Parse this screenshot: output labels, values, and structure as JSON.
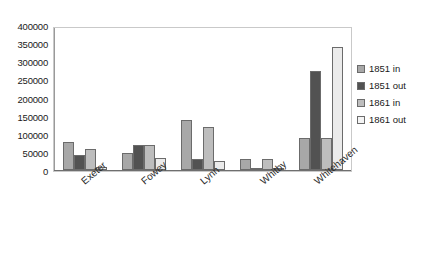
{
  "chart_data": {
    "type": "bar",
    "title": "",
    "subtitle": "",
    "xlabel": "",
    "ylabel": "",
    "categories": [
      "Exeter",
      "Fowey",
      "Lynn",
      "Whitby",
      "Whitehaven"
    ],
    "series": [
      {
        "name": "1851 in",
        "color": "#a8a8a8",
        "values": [
          78000,
          48000,
          140000,
          30000,
          90000
        ]
      },
      {
        "name": "1851 out",
        "color": "#525252",
        "values": [
          42000,
          70000,
          30000,
          3000,
          278000
        ]
      },
      {
        "name": "1861 in",
        "color": "#bdbdbd",
        "values": [
          58000,
          70000,
          120000,
          30000,
          90000
        ]
      },
      {
        "name": "1861 out",
        "color": "#ebebeb",
        "values": [
          9000,
          35000,
          25000,
          5000,
          345000
        ]
      }
    ],
    "ylim": [
      0,
      400000
    ],
    "ytick_step": 50000,
    "yticks": [
      400000,
      350000,
      300000,
      250000,
      200000,
      150000,
      100000,
      50000,
      0
    ],
    "ytick_labels": [
      "400000",
      "350000",
      "300000",
      "250000",
      "200000",
      "150000",
      "100000",
      "50000",
      "0"
    ],
    "grid": false,
    "legend_position": "right",
    "legend_entries": [
      "1851 in",
      "1851 out",
      "1861 in",
      "1861 out"
    ],
    "plot_border_color": "#c9c9c9",
    "axis_color": "#6f6f6f",
    "background_color": "#ffffff"
  }
}
